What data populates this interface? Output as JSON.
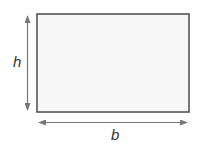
{
  "diagram": {
    "type": "rectangle-dimensions",
    "shape": {
      "fill": "#f7f7f7",
      "stroke": "#555555"
    },
    "height_label": "h",
    "base_label": "b",
    "arrow_color": "#777777"
  }
}
